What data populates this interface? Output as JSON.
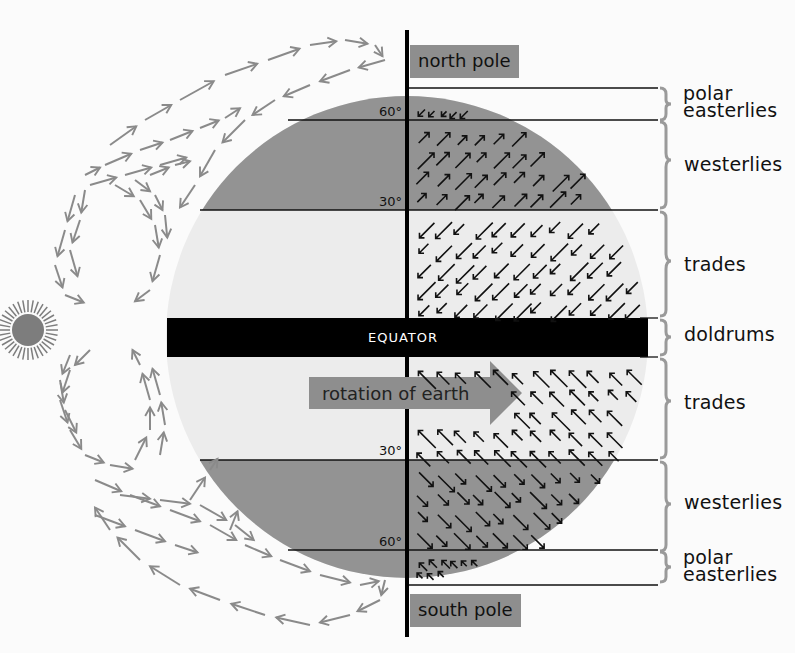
{
  "colors": {
    "background": "#fbfbfb",
    "globe_light": "#ececec",
    "globe_dark": "#939393",
    "equator_band": "#000000",
    "pole_box": "#8e8e8e",
    "arrow_gray": "#8a8a8a",
    "arrow_black": "#111111",
    "brace_gray": "#9a9a9a",
    "sun": "#7d7d7d"
  },
  "poles": {
    "north": "north pole",
    "south": "south pole"
  },
  "equator_label": "EQUATOR",
  "rotation_label": "rotation of earth",
  "latitudes": {
    "n60": "60°",
    "n30": "30°",
    "s30": "30°",
    "s60": "60°"
  },
  "belts": [
    {
      "id": "polar-easterlies-north",
      "label_line1": "polar",
      "label_line2": "easterlies",
      "hemisphere": "north",
      "arrow_direction": "southwest"
    },
    {
      "id": "westerlies-north",
      "label_line1": "westerlies",
      "hemisphere": "north",
      "arrow_direction": "northeast"
    },
    {
      "id": "trades-north",
      "label_line1": "trades",
      "hemisphere": "north",
      "arrow_direction": "southwest"
    },
    {
      "id": "doldrums",
      "label_line1": "doldrums",
      "hemisphere": "equator"
    },
    {
      "id": "trades-south",
      "label_line1": "trades",
      "hemisphere": "south",
      "arrow_direction": "northwest"
    },
    {
      "id": "westerlies-south",
      "label_line1": "westerlies",
      "hemisphere": "south",
      "arrow_direction": "southeast"
    },
    {
      "id": "polar-easterlies-south",
      "label_line1": "polar",
      "label_line2": "easterlies",
      "hemisphere": "south",
      "arrow_direction": "northwest"
    }
  ],
  "icons": {
    "sun": "sun-icon",
    "rotation_arrow": "right-arrow-icon"
  }
}
